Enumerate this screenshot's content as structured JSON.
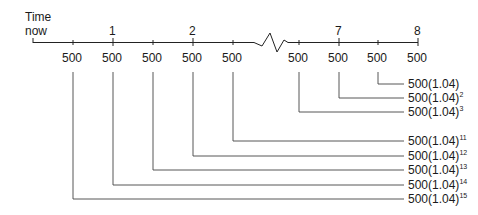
{
  "timeline": {
    "start_label_line1": "Time",
    "start_label_line2": "now",
    "period_labels": [
      {
        "label": "1",
        "x": 113
      },
      {
        "label": "2",
        "x": 193
      },
      {
        "label": "7",
        "x": 339
      },
      {
        "label": "8",
        "x": 418
      }
    ],
    "payments": [
      {
        "amount": "500",
        "x": 73
      },
      {
        "amount": "500",
        "x": 113
      },
      {
        "amount": "500",
        "x": 153
      },
      {
        "amount": "500",
        "x": 193
      },
      {
        "amount": "500",
        "x": 233
      },
      {
        "amount": "500",
        "x": 299
      },
      {
        "amount": "500",
        "x": 339
      },
      {
        "amount": "500",
        "x": 378
      },
      {
        "amount": "500",
        "x": 418
      }
    ],
    "break_symbol": "zigzag"
  },
  "future_values": [
    {
      "base": "500(1.04)",
      "exp": "",
      "y": 84,
      "from_x": 378
    },
    {
      "base": "500(1.04)",
      "exp": "2",
      "y": 98,
      "from_x": 339
    },
    {
      "base": "500(1.04)",
      "exp": "3",
      "y": 112,
      "from_x": 299
    },
    {
      "base": "500(1.04)",
      "exp": "11",
      "y": 141,
      "from_x": 233
    },
    {
      "base": "500(1.04)",
      "exp": "12",
      "y": 156,
      "from_x": 193
    },
    {
      "base": "500(1.04)",
      "exp": "13",
      "y": 170,
      "from_x": 153
    },
    {
      "base": "500(1.04)",
      "exp": "14",
      "y": 185,
      "from_x": 113
    },
    {
      "base": "500(1.04)",
      "exp": "15",
      "y": 199,
      "from_x": 73
    }
  ]
}
